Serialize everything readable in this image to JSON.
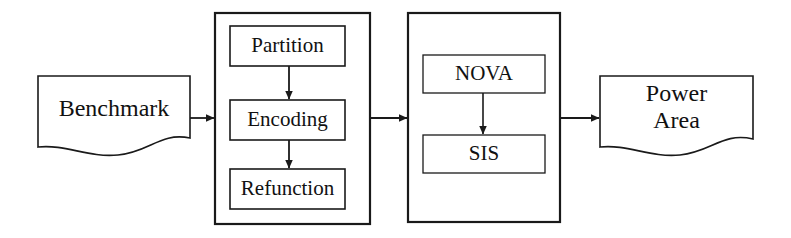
{
  "diagram": {
    "background_color": "#ffffff",
    "stroke_color": "#1a1a1a",
    "text_color": "#111111",
    "nodes": {
      "benchmark": {
        "label": "Benchmark",
        "shape": "document"
      },
      "partition": {
        "label": "Partition",
        "shape": "rectangle"
      },
      "encoding": {
        "label": "Encoding",
        "shape": "rectangle"
      },
      "refunction": {
        "label": "Refunction",
        "shape": "rectangle"
      },
      "nova": {
        "label": "NOVA",
        "shape": "rectangle"
      },
      "sis": {
        "label": "SIS",
        "shape": "rectangle"
      },
      "power_area": {
        "label": "Power\nArea",
        "shape": "document"
      }
    },
    "groups": {
      "left_container": {
        "label": "",
        "contains": [
          "partition",
          "encoding",
          "refunction"
        ]
      },
      "right_container": {
        "label": "",
        "contains": [
          "nova",
          "sis"
        ]
      }
    },
    "edges": [
      {
        "from": "benchmark",
        "to": "left_container",
        "direction": "right"
      },
      {
        "from": "partition",
        "to": "encoding",
        "direction": "down"
      },
      {
        "from": "encoding",
        "to": "refunction",
        "direction": "down"
      },
      {
        "from": "left_container",
        "to": "right_container",
        "direction": "right"
      },
      {
        "from": "nova",
        "to": "sis",
        "direction": "down"
      },
      {
        "from": "right_container",
        "to": "power_area",
        "direction": "right"
      }
    ]
  }
}
